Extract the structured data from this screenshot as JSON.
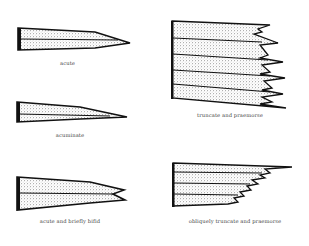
{
  "diagram": {
    "figures": [
      {
        "id": "acute",
        "caption": "acute"
      },
      {
        "id": "acuminate",
        "caption": "acuminate"
      },
      {
        "id": "acute-bifid",
        "caption": "acute and briefly bifid"
      },
      {
        "id": "truncate-praemorse",
        "caption": "truncate and praemorse"
      },
      {
        "id": "obliquely-truncate-praemorse",
        "caption": "obliquely truncate and praemorse"
      }
    ],
    "colors": {
      "ink": "#111111",
      "stipple": "#555555",
      "background": "#ffffff"
    }
  }
}
